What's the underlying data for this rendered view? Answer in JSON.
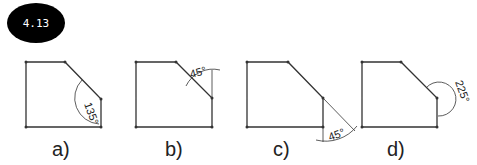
{
  "figure": {
    "badge": "4.13",
    "panels": [
      {
        "label": "a)",
        "angle": "135°",
        "x": 52
      },
      {
        "label": "b)",
        "angle": "45°",
        "x": 165
      },
      {
        "label": "c)",
        "angle": "45°",
        "x": 273
      },
      {
        "label": "d)",
        "angle": "225°",
        "x": 387
      }
    ]
  }
}
